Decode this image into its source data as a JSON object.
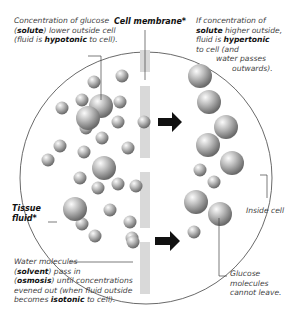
{
  "labels": {
    "glucose_conc": {
      "parts": [
        "Concentration of ",
        "glucose (",
        "solute",
        ") lower outside cell (fluid is ",
        "hypotonic",
        " to cell)."
      ]
    },
    "cell_membrane": "Cell membrane*",
    "hypertonic": {
      "parts": [
        "If concentration of ",
        "solute",
        " higher outside, fluid is ",
        "hypertonic",
        " to cell (and",
        "water passes",
        "outwards)."
      ]
    },
    "tissue_fluid": "Tissue fluid*",
    "water_molecules": {
      "parts": [
        "Water molecules",
        "(",
        "solvent",
        ") pass in",
        "(",
        "osmosis",
        ") until concentrations",
        "evened out (when fluid outside",
        "becomes ",
        "isotonic",
        " to cell)."
      ]
    },
    "inside_cell": "Inside cell",
    "glucose_leave": "Glucose molecules cannot leave."
  },
  "colors": {
    "membrane": "#d9d9d9",
    "sphere_dark": "#707070",
    "sphere_light": "#f4f4f4",
    "arrow": "#111111",
    "line": "#444444"
  },
  "small_molecules": [
    [
      94,
      82
    ],
    [
      122,
      76
    ],
    [
      82,
      100
    ],
    [
      62,
      108
    ],
    [
      120,
      102
    ],
    [
      86,
      128
    ],
    [
      102,
      138
    ],
    [
      118,
      122
    ],
    [
      60,
      146
    ],
    [
      84,
      152
    ],
    [
      128,
      148
    ],
    [
      48,
      160
    ],
    [
      80,
      178
    ],
    [
      98,
      188
    ],
    [
      118,
      184
    ],
    [
      136,
      186
    ],
    [
      110,
      210
    ],
    [
      130,
      222
    ],
    [
      82,
      224
    ],
    [
      95,
      236
    ],
    [
      132,
      238
    ],
    [
      200,
      170
    ],
    [
      214,
      182
    ],
    [
      194,
      232
    ],
    [
      144,
      122
    ],
    [
      133,
      242
    ]
  ],
  "large_molecules": [
    [
      101,
      106
    ],
    [
      104,
      168
    ],
    [
      75,
      209
    ],
    [
      200,
      76
    ],
    [
      209,
      102
    ],
    [
      226,
      127
    ],
    [
      208,
      145
    ],
    [
      232,
      163
    ],
    [
      196,
      202
    ],
    [
      220,
      214
    ],
    [
      88,
      118
    ]
  ]
}
